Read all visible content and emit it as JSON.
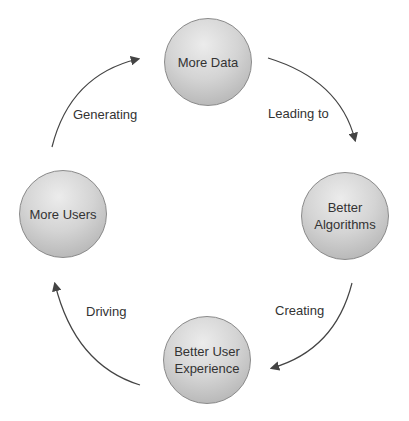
{
  "nodes": [
    {
      "label": "More Data"
    },
    {
      "label": "Better Algorithms"
    },
    {
      "label": "Better User Experience"
    },
    {
      "label": "More Users"
    }
  ],
  "edges": [
    {
      "from": "More Data",
      "to": "Better Algorithms",
      "label": "Leading to"
    },
    {
      "from": "Better Algorithms",
      "to": "Better User Experience",
      "label": "Creating"
    },
    {
      "from": "Better User Experience",
      "to": "More Users",
      "label": "Driving"
    },
    {
      "from": "More Users",
      "to": "More Data",
      "label": "Generating"
    }
  ],
  "colors": {
    "node_fill": "#d0d0d0",
    "arrow": "#444444",
    "text": "#333333"
  }
}
